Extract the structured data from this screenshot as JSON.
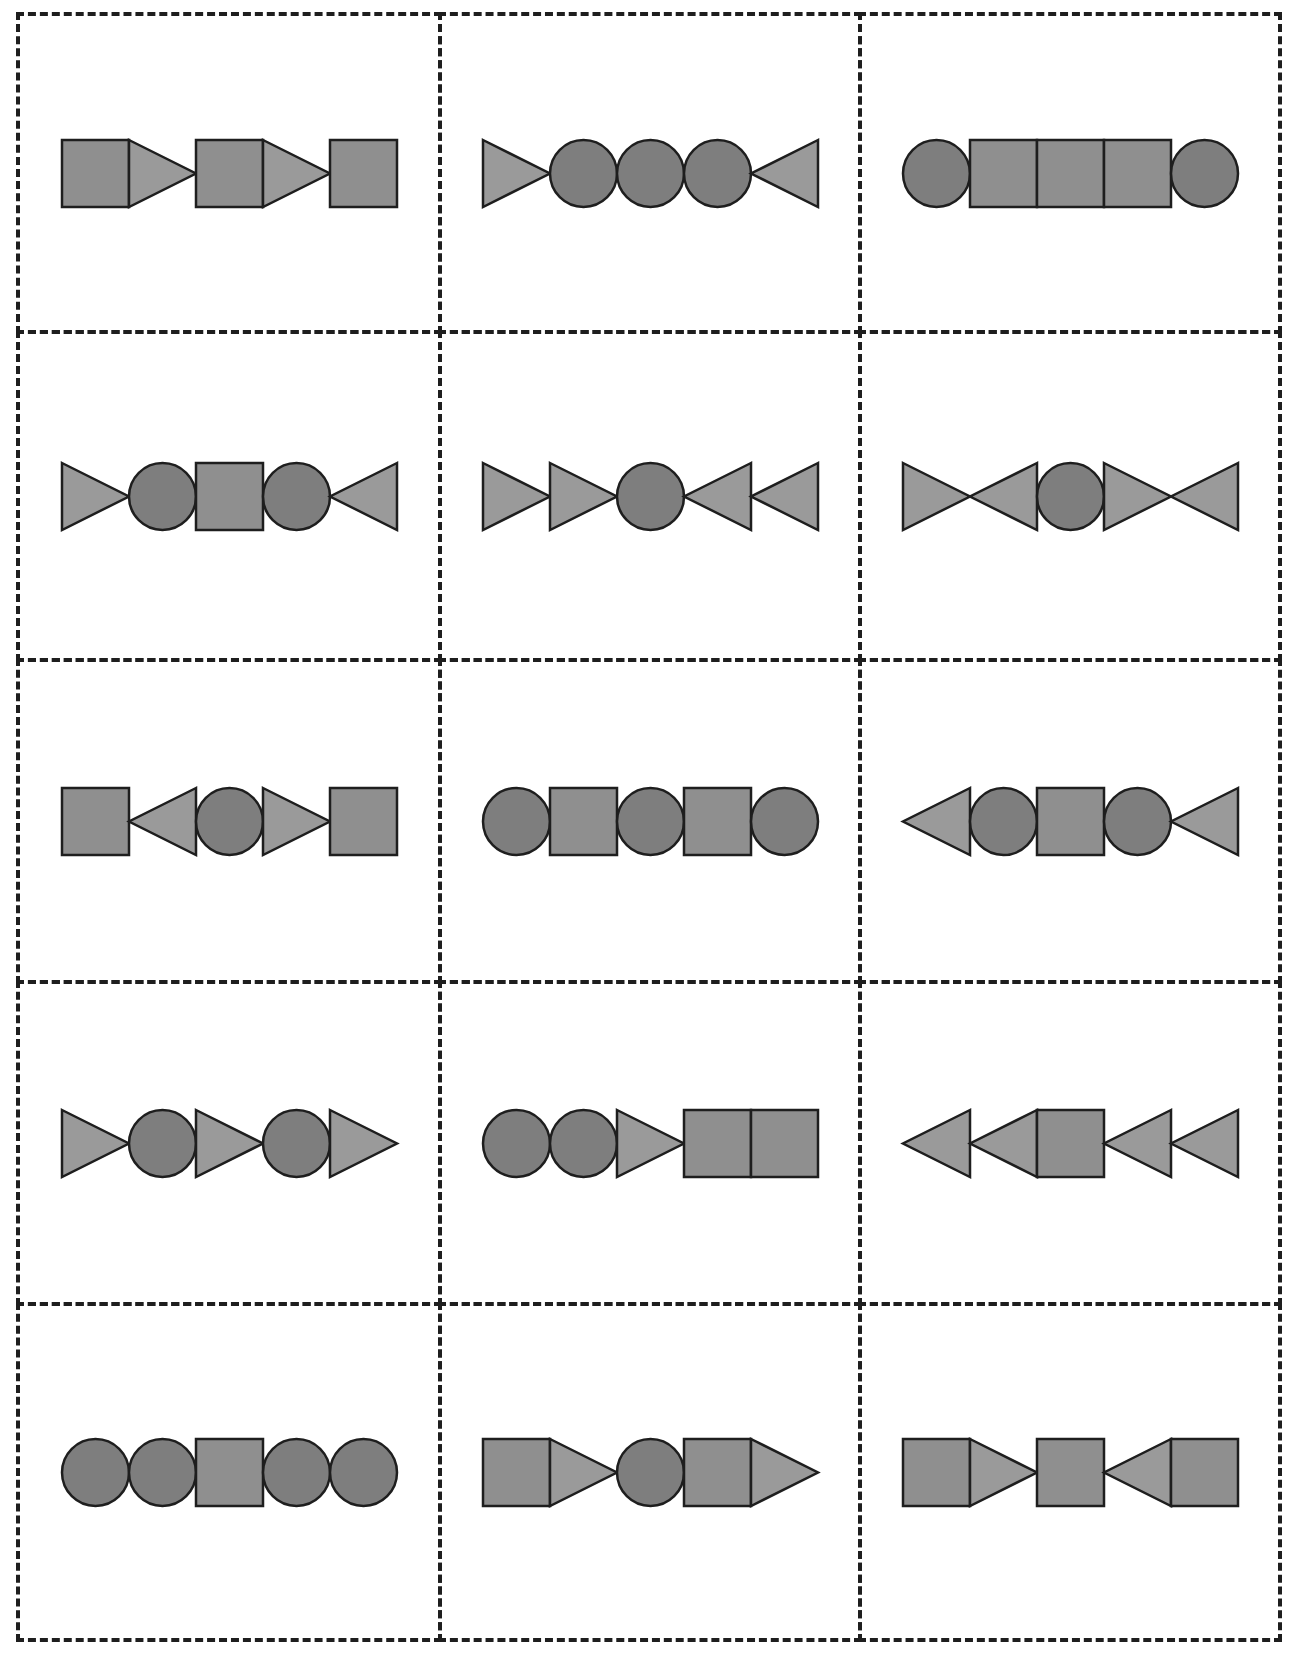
{
  "worksheet": {
    "layout": {
      "rows": 5,
      "columns": 3
    },
    "colors": {
      "square_fill": "#8f8f8f",
      "triangle_fill": "#9a9a9a",
      "circle_fill": "#7e7e7e",
      "outline": "#1e1e1e",
      "cut_line": "#1e1e1e",
      "background": "#ffffff"
    },
    "cards": [
      {
        "row": 1,
        "col": 1,
        "shapes": [
          "square",
          "triangle-right",
          "square",
          "triangle-right",
          "square"
        ]
      },
      {
        "row": 1,
        "col": 2,
        "shapes": [
          "triangle-right",
          "circle",
          "circle",
          "circle",
          "triangle-left"
        ]
      },
      {
        "row": 1,
        "col": 3,
        "shapes": [
          "circle",
          "square",
          "square",
          "square",
          "circle"
        ]
      },
      {
        "row": 2,
        "col": 1,
        "shapes": [
          "triangle-right",
          "circle",
          "square",
          "circle",
          "triangle-left"
        ]
      },
      {
        "row": 2,
        "col": 2,
        "shapes": [
          "triangle-right",
          "triangle-right",
          "circle",
          "triangle-left",
          "triangle-left"
        ]
      },
      {
        "row": 2,
        "col": 3,
        "shapes": [
          "triangle-right",
          "triangle-left",
          "circle",
          "triangle-right",
          "triangle-left"
        ]
      },
      {
        "row": 3,
        "col": 1,
        "shapes": [
          "square",
          "triangle-left",
          "circle",
          "triangle-right",
          "square"
        ]
      },
      {
        "row": 3,
        "col": 2,
        "shapes": [
          "circle",
          "square",
          "circle",
          "square",
          "circle"
        ]
      },
      {
        "row": 3,
        "col": 3,
        "shapes": [
          "triangle-left",
          "circle",
          "square",
          "circle",
          "triangle-left"
        ]
      },
      {
        "row": 4,
        "col": 1,
        "shapes": [
          "triangle-right",
          "circle",
          "triangle-right",
          "circle",
          "triangle-right"
        ]
      },
      {
        "row": 4,
        "col": 2,
        "shapes": [
          "circle",
          "circle",
          "triangle-right",
          "square",
          "square"
        ]
      },
      {
        "row": 4,
        "col": 3,
        "shapes": [
          "triangle-left",
          "triangle-left",
          "square",
          "triangle-left",
          "triangle-left"
        ]
      },
      {
        "row": 5,
        "col": 1,
        "shapes": [
          "circle",
          "circle",
          "square",
          "circle",
          "circle"
        ]
      },
      {
        "row": 5,
        "col": 2,
        "shapes": [
          "square",
          "triangle-right",
          "circle",
          "square",
          "triangle-right"
        ]
      },
      {
        "row": 5,
        "col": 3,
        "shapes": [
          "square",
          "triangle-right",
          "square",
          "triangle-left",
          "square"
        ]
      }
    ]
  }
}
